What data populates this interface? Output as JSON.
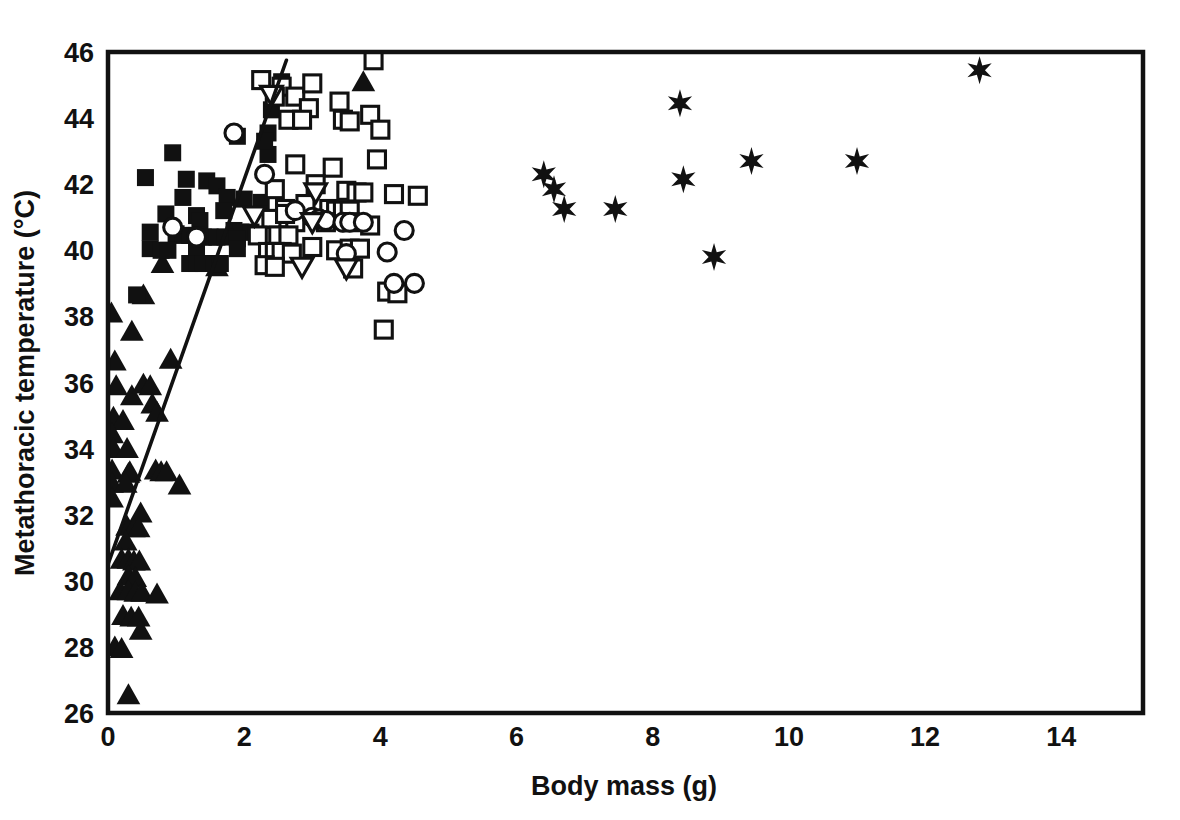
{
  "chart_data": {
    "type": "scatter",
    "title": "",
    "xlabel": "Body mass (g)",
    "ylabel": "Metathoracic temperature (°C)",
    "xlim": [
      0,
      15.2
    ],
    "ylim": [
      26,
      46
    ],
    "xticks": [
      0,
      2,
      4,
      6,
      8,
      10,
      12,
      14
    ],
    "yticks": [
      26,
      28,
      30,
      32,
      34,
      36,
      38,
      40,
      42,
      44,
      46
    ],
    "xtick_labels": [
      "0",
      "2",
      "4",
      "6",
      "8",
      "10",
      "12",
      "14"
    ],
    "ytick_labels": [
      "26",
      "28",
      "30",
      "32",
      "34",
      "36",
      "38",
      "40",
      "42",
      "44",
      "46"
    ],
    "grid": false,
    "legend": "none",
    "marker_color": "#111111",
    "series": [
      {
        "name": "filled-triangle",
        "marker": "triangle-up-filled",
        "points": [
          [
            0.05,
            38.1
          ],
          [
            0.1,
            36.65
          ],
          [
            0.52,
            38.65
          ],
          [
            0.35,
            37.55
          ],
          [
            0.12,
            35.9
          ],
          [
            0.35,
            35.6
          ],
          [
            0.92,
            36.7
          ],
          [
            0.52,
            35.95
          ],
          [
            0.62,
            35.9
          ],
          [
            0.65,
            35.35
          ],
          [
            0.72,
            35.1
          ],
          [
            0.08,
            34.95
          ],
          [
            0.22,
            34.85
          ],
          [
            0.06,
            34.45
          ],
          [
            0.08,
            34.0
          ],
          [
            0.28,
            34.0
          ],
          [
            0.7,
            33.35
          ],
          [
            0.78,
            33.3
          ],
          [
            0.86,
            33.3
          ],
          [
            0.06,
            33.35
          ],
          [
            0.3,
            33.25
          ],
          [
            0.32,
            33.3
          ],
          [
            1.05,
            32.9
          ],
          [
            0.06,
            32.95
          ],
          [
            0.26,
            32.95
          ],
          [
            0.06,
            32.5
          ],
          [
            0.48,
            32.05
          ],
          [
            0.28,
            31.65
          ],
          [
            0.38,
            31.6
          ],
          [
            0.45,
            31.6
          ],
          [
            0.26,
            31.2
          ],
          [
            0.2,
            30.65
          ],
          [
            0.3,
            30.65
          ],
          [
            0.38,
            30.6
          ],
          [
            0.46,
            30.6
          ],
          [
            0.3,
            30.15
          ],
          [
            0.4,
            30.1
          ],
          [
            0.18,
            29.7
          ],
          [
            0.3,
            29.7
          ],
          [
            0.4,
            29.65
          ],
          [
            0.5,
            29.65
          ],
          [
            0.72,
            29.6
          ],
          [
            0.22,
            28.95
          ],
          [
            0.34,
            28.9
          ],
          [
            0.45,
            28.9
          ],
          [
            0.48,
            28.5
          ],
          [
            0.1,
            28.0
          ],
          [
            0.2,
            27.95
          ],
          [
            0.3,
            26.55
          ],
          [
            0.8,
            39.6
          ],
          [
            1.6,
            39.5
          ],
          [
            3.75,
            45.1
          ]
        ]
      },
      {
        "name": "filled-square",
        "marker": "square-filled",
        "points": [
          [
            0.95,
            42.95
          ],
          [
            0.55,
            42.2
          ],
          [
            1.15,
            42.15
          ],
          [
            1.45,
            42.1
          ],
          [
            1.1,
            41.6
          ],
          [
            1.6,
            41.95
          ],
          [
            1.75,
            41.6
          ],
          [
            0.85,
            41.1
          ],
          [
            1.3,
            41.05
          ],
          [
            1.35,
            40.9
          ],
          [
            2.0,
            41.55
          ],
          [
            1.7,
            41.2
          ],
          [
            2.25,
            41.45
          ],
          [
            1.85,
            40.6
          ],
          [
            1.95,
            40.55
          ],
          [
            2.1,
            40.55
          ],
          [
            0.62,
            40.55
          ],
          [
            1.0,
            40.5
          ],
          [
            1.1,
            40.45
          ],
          [
            1.2,
            40.45
          ],
          [
            1.3,
            40.45
          ],
          [
            1.4,
            40.4
          ],
          [
            1.5,
            40.4
          ],
          [
            1.6,
            40.4
          ],
          [
            1.72,
            40.4
          ],
          [
            1.9,
            40.35
          ],
          [
            0.62,
            40.05
          ],
          [
            0.78,
            40.0
          ],
          [
            0.88,
            40.0
          ],
          [
            1.3,
            40.0
          ],
          [
            1.9,
            40.05
          ],
          [
            1.2,
            39.6
          ],
          [
            1.3,
            39.6
          ],
          [
            1.4,
            39.6
          ],
          [
            1.55,
            39.6
          ],
          [
            1.65,
            39.6
          ],
          [
            0.42,
            38.65
          ],
          [
            2.35,
            42.9
          ],
          [
            2.4,
            44.25
          ],
          [
            2.35,
            43.55
          ],
          [
            2.3,
            43.3
          ],
          [
            2.55,
            45.1
          ],
          [
            1.9,
            43.45
          ]
        ]
      },
      {
        "name": "open-square",
        "marker": "square-open",
        "points": [
          [
            2.25,
            45.15
          ],
          [
            2.55,
            44.95
          ],
          [
            2.75,
            44.65
          ],
          [
            3.0,
            45.05
          ],
          [
            2.95,
            44.3
          ],
          [
            3.4,
            44.5
          ],
          [
            3.45,
            43.95
          ],
          [
            3.55,
            43.9
          ],
          [
            3.9,
            45.75
          ],
          [
            3.85,
            44.1
          ],
          [
            4.0,
            43.65
          ],
          [
            3.95,
            42.75
          ],
          [
            2.75,
            42.6
          ],
          [
            2.45,
            41.85
          ],
          [
            3.3,
            42.5
          ],
          [
            3.05,
            42.0
          ],
          [
            3.5,
            41.8
          ],
          [
            3.65,
            41.75
          ],
          [
            3.75,
            41.75
          ],
          [
            4.2,
            41.7
          ],
          [
            4.55,
            41.65
          ],
          [
            2.6,
            41.25
          ],
          [
            2.9,
            41.4
          ],
          [
            3.25,
            41.25
          ],
          [
            3.35,
            41.2
          ],
          [
            3.45,
            41.2
          ],
          [
            3.55,
            41.2
          ],
          [
            2.4,
            40.95
          ],
          [
            2.75,
            40.85
          ],
          [
            3.2,
            40.85
          ],
          [
            3.55,
            40.85
          ],
          [
            3.85,
            40.75
          ],
          [
            2.2,
            40.45
          ],
          [
            2.5,
            40.45
          ],
          [
            2.65,
            40.45
          ],
          [
            3.0,
            40.1
          ],
          [
            2.35,
            39.95
          ],
          [
            2.45,
            39.95
          ],
          [
            2.55,
            39.95
          ],
          [
            2.7,
            39.9
          ],
          [
            3.35,
            40.0
          ],
          [
            3.55,
            40.05
          ],
          [
            3.7,
            40.05
          ],
          [
            2.3,
            39.55
          ],
          [
            2.45,
            39.5
          ],
          [
            3.6,
            39.45
          ],
          [
            4.1,
            38.75
          ],
          [
            4.25,
            38.7
          ],
          [
            4.05,
            37.6
          ],
          [
            2.6,
            41.1
          ],
          [
            2.65,
            43.95
          ],
          [
            2.85,
            43.95
          ],
          [
            2.45,
            44.65
          ]
        ]
      },
      {
        "name": "open-circle",
        "marker": "circle-open",
        "points": [
          [
            1.85,
            43.55
          ],
          [
            0.95,
            40.7
          ],
          [
            1.3,
            40.4
          ],
          [
            2.3,
            42.3
          ],
          [
            2.75,
            41.2
          ],
          [
            3.0,
            41.0
          ],
          [
            3.1,
            40.95
          ],
          [
            3.2,
            40.9
          ],
          [
            3.45,
            40.85
          ],
          [
            3.55,
            40.85
          ],
          [
            3.75,
            40.85
          ],
          [
            3.5,
            39.9
          ],
          [
            4.1,
            39.95
          ],
          [
            4.2,
            39.0
          ],
          [
            4.5,
            39.0
          ],
          [
            4.35,
            40.6
          ]
        ]
      },
      {
        "name": "open-inverted-triangle",
        "marker": "triangle-down-open",
        "points": [
          [
            2.4,
            44.7
          ],
          [
            3.05,
            41.75
          ],
          [
            2.15,
            41.05
          ],
          [
            3.0,
            40.85
          ],
          [
            2.85,
            39.5
          ],
          [
            3.5,
            39.45
          ]
        ]
      },
      {
        "name": "filled-star",
        "marker": "star6-filled",
        "points": [
          [
            6.4,
            42.3
          ],
          [
            6.55,
            41.85
          ],
          [
            6.7,
            41.25
          ],
          [
            7.45,
            41.25
          ],
          [
            8.4,
            44.45
          ],
          [
            8.45,
            42.15
          ],
          [
            8.9,
            39.8
          ],
          [
            9.45,
            42.7
          ],
          [
            11.0,
            42.7
          ],
          [
            12.8,
            45.45
          ]
        ]
      }
    ],
    "fit_line": {
      "label": "regression-line",
      "x1": 0.0,
      "y1": 30.5,
      "x2": 2.62,
      "y2": 45.75
    }
  }
}
